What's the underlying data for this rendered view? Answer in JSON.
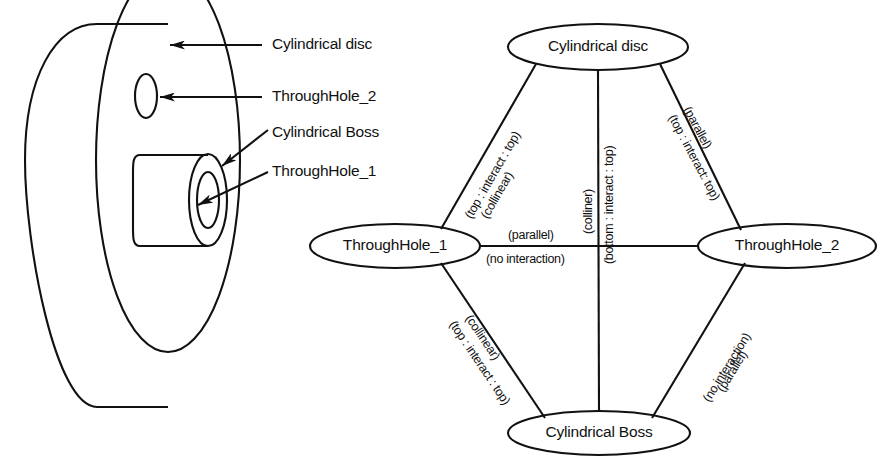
{
  "figure": {
    "kind": "feature-interaction-graph",
    "part_drawing": {
      "callouts": [
        {
          "id": "cylindrical-disc",
          "text": "Cylindrical disc"
        },
        {
          "id": "throughhole-2",
          "text": "ThroughHole_2"
        },
        {
          "id": "cylindrical-boss",
          "text": "Cylindrical Boss"
        },
        {
          "id": "throughhole-1",
          "text": "ThroughHole_1"
        }
      ]
    },
    "graph": {
      "nodes": [
        {
          "id": "cylindrical-disc",
          "label": "Cylindrical disc",
          "cx": 598,
          "cy": 47,
          "rx": 90,
          "ry": 23
        },
        {
          "id": "throughhole-1",
          "label": "ThroughHole_1",
          "cx": 395,
          "cy": 246,
          "rx": 85,
          "ry": 22
        },
        {
          "id": "throughhole-2",
          "label": "ThroughHole_2",
          "cx": 787,
          "cy": 246,
          "rx": 89,
          "ry": 22
        },
        {
          "id": "cylindrical-boss",
          "label": "Cylindrical Boss",
          "cx": 599,
          "cy": 433,
          "rx": 91,
          "ry": 22
        }
      ],
      "edges": [
        {
          "id": "disc-to-hole1",
          "from": "cylindrical-disc",
          "to": "throughhole-1",
          "line1": "(collinear)",
          "line2": "(top : interact : top)"
        },
        {
          "id": "disc-to-boss",
          "from": "cylindrical-disc",
          "to": "cylindrical-boss",
          "line1": "(colliner)",
          "line2": "(bottom : interact : top)"
        },
        {
          "id": "disc-to-hole2",
          "from": "cylindrical-disc",
          "to": "throughhole-2",
          "line1": "(parallel)",
          "line2": "(top : interact: top)"
        },
        {
          "id": "hole1-to-hole2",
          "from": "throughhole-1",
          "to": "throughhole-2",
          "line1": "(parallel)",
          "line2": "(no interaction)"
        },
        {
          "id": "hole1-to-boss",
          "from": "throughhole-1",
          "to": "cylindrical-boss",
          "line1": "(collinear)",
          "line2": "(top : interact : top)"
        },
        {
          "id": "hole2-to-boss",
          "from": "throughhole-2",
          "to": "cylindrical-boss",
          "line1": "(parallel)",
          "line2": "(no interaction)"
        }
      ]
    },
    "colors": {
      "ink": "#111111",
      "background": "#ffffff"
    }
  }
}
